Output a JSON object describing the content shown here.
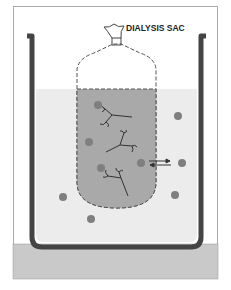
{
  "diagram": {
    "label": "DIALYSIS SAC",
    "colors": {
      "beaker": "#444444",
      "solution": "#ececec",
      "sac_fill": "#a9a9a9",
      "particle": "#7f7f7f",
      "base": "#c9c9c9"
    },
    "particles_inside": 3,
    "particles_outside": 6,
    "macromolecules_inside": 3
  }
}
